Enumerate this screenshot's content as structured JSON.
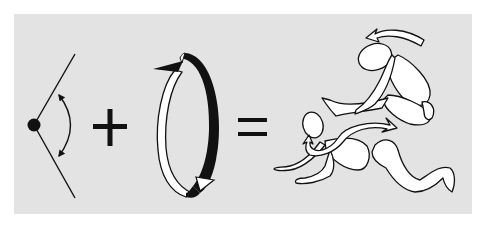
{
  "diagram": {
    "description": "Angle of joint motion plus rotation equals resulting body movement (rolling over)",
    "colors": {
      "panel_background": "#e3e3e3",
      "page_background": "#ffffff",
      "stroke": "#111111",
      "fill_light": "#ffffff"
    },
    "parts": [
      {
        "id": "angle",
        "label": "joint angle with double-headed arc arrow",
        "icon": "angle-icon"
      },
      {
        "id": "plus",
        "symbol": "+",
        "icon": "plus-icon"
      },
      {
        "id": "rotation",
        "label": "rotation ring with arrows (white band left, black band right)",
        "icon": "rotation-ring-icon"
      },
      {
        "id": "equals",
        "symbol": "=",
        "icon": "equals-icon"
      },
      {
        "id": "figures",
        "label": "two human figures performing roll-over movement with curved arrows",
        "icon": "human-figures-icon"
      }
    ]
  }
}
